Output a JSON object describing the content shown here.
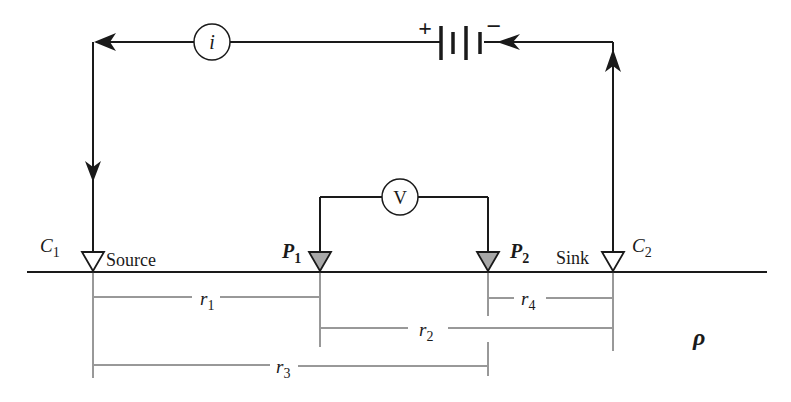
{
  "diagram": {
    "current_meter": {
      "symbol": "i"
    },
    "voltmeter": {
      "symbol": "V"
    },
    "battery": {
      "plus": "+",
      "minus": "−"
    },
    "electrodes": [
      {
        "id": "C1",
        "name": "C",
        "sub": "1",
        "role": "Source",
        "filled": false
      },
      {
        "id": "P1",
        "name": "P",
        "sub": "1",
        "role": "",
        "filled": true
      },
      {
        "id": "P2",
        "name": "P",
        "sub": "2",
        "role": "",
        "filled": true
      },
      {
        "id": "C2",
        "name": "C",
        "sub": "2",
        "role": "Sink",
        "filled": false
      }
    ],
    "distances": [
      {
        "name": "r",
        "sub": "1",
        "from": "C1",
        "to": "P1"
      },
      {
        "name": "r",
        "sub": "2",
        "from": "P1",
        "to": "C2"
      },
      {
        "name": "r",
        "sub": "3",
        "from": "C1",
        "to": "P2"
      },
      {
        "name": "r",
        "sub": "4",
        "from": "P2",
        "to": "C2"
      }
    ],
    "medium": {
      "symbol": "ρ"
    },
    "colors": {
      "line": "#1a1a1a",
      "fill_potential": "#a8a8a8",
      "background": "#ffffff"
    }
  }
}
